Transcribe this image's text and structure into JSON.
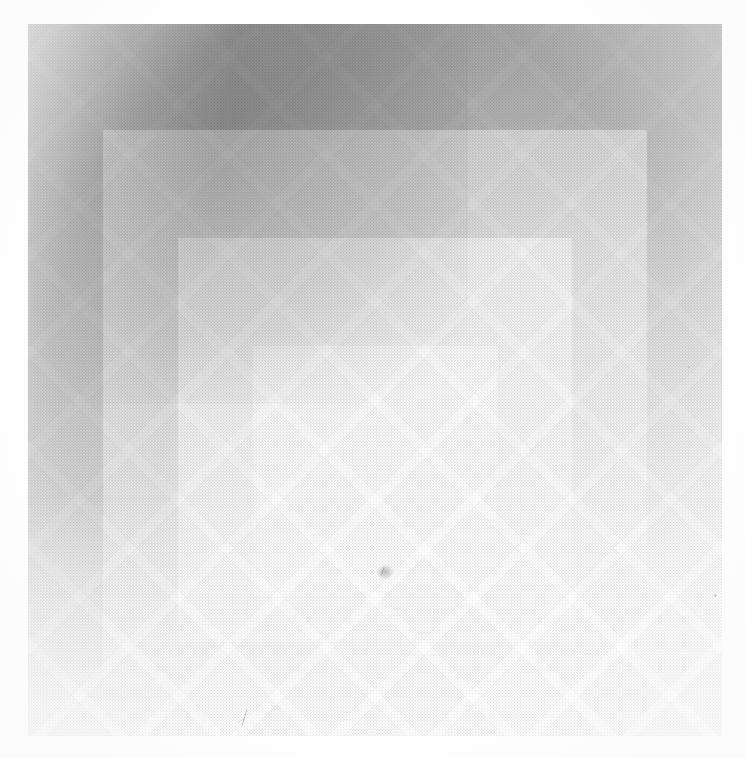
{
  "page": {
    "kind": "reproduction-of-artwork",
    "medium": "halftone print on paper",
    "background_color": "#ffffff",
    "width_px": 745,
    "height_px": 758
  },
  "plate": {
    "name": "nested-squares-composition",
    "style": "homage-to-the-square",
    "left_px": 28,
    "top_px": 24,
    "width_px": 694,
    "height_px": 712,
    "square_count": 4
  },
  "squares": [
    {
      "index": 1,
      "role": "outermost-ground",
      "color": "#9d9d9d",
      "tone": "dark gray",
      "left_px": 0,
      "top_px": 0,
      "width_px": 694,
      "height_px": 712
    },
    {
      "index": 2,
      "role": "second-band",
      "color": "#c6c6c6",
      "tone": "medium gray",
      "left_px": 75,
      "top_px": 106,
      "width_px": 544,
      "height_px": 558
    },
    {
      "index": 3,
      "role": "third-band",
      "color": "#e2e2e2",
      "tone": "light gray",
      "left_px": 150,
      "top_px": 214,
      "width_px": 394,
      "height_px": 404
    },
    {
      "index": 4,
      "role": "innermost-square",
      "color": "#f0f0f0",
      "tone": "near white",
      "left_px": 225,
      "top_px": 322,
      "width_px": 244,
      "height_px": 250
    }
  ],
  "lighting": {
    "description": "illumination falls off from upper-left to lower-right, washing the lower half toward paper white",
    "dark_corner": "top-left",
    "bright_corner": "bottom-left"
  },
  "texture": {
    "halftone_screen_angle_deg": 45,
    "paper_grain": "visible"
  },
  "blemishes": [
    {
      "name": "center-speck",
      "left_px": 349,
      "top_px": 541
    },
    {
      "name": "lower-left-mark",
      "left_px": 208,
      "top_px": 685
    },
    {
      "name": "right-speck",
      "left_px": 686,
      "top_px": 570
    },
    {
      "name": "upper-right-speck",
      "left_px": 660,
      "top_px": 342
    },
    {
      "name": "left-margin-mark",
      "left_px": 6,
      "top_px": 286
    }
  ],
  "alt_text": "Four nested gray squares of decreasing size, each offset toward the bottom, printed in halftone on white paper."
}
